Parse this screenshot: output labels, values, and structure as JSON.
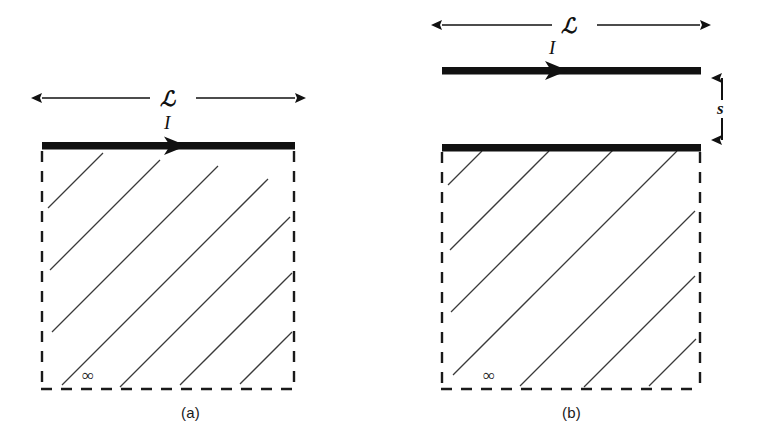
{
  "figure": {
    "background_color": "#ffffff",
    "ink_color": "#111111",
    "hatch_color": "#3a3a3a",
    "width": 762,
    "height": 447
  },
  "panels": [
    {
      "id": "a",
      "caption": "(a)",
      "length_label": "ℒ",
      "current_label": "I",
      "infinity_label": "∞",
      "has_separated_wire": false,
      "separation_label": null,
      "description": "Current-carrying strip of length L lying directly on the boundary of a semi-infinite conducting half-space"
    },
    {
      "id": "b",
      "caption": "(b)",
      "length_label": "ℒ",
      "current_label": "I",
      "infinity_label": "∞",
      "has_separated_wire": true,
      "separation_label": "s",
      "description": "Current-carrying strip of length L held a distance s above the boundary of a semi-infinite conducting half-space"
    }
  ]
}
